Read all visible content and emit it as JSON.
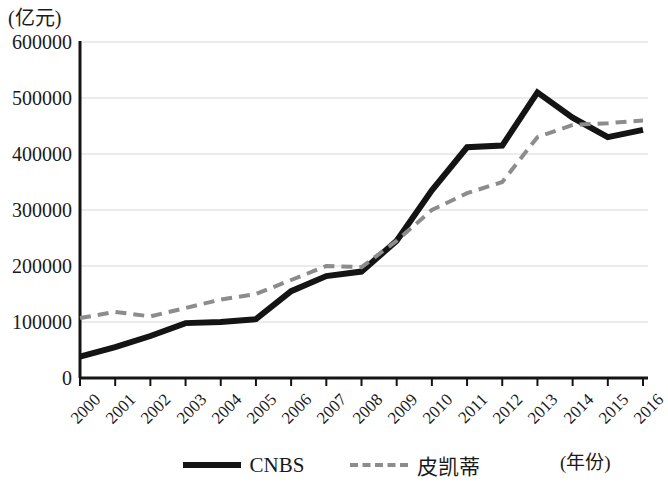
{
  "chart_data": {
    "type": "line",
    "title": "",
    "subtitle": "",
    "xlabel": "(年份)",
    "ylabel": "(亿元)",
    "x": [
      2000,
      2001,
      2002,
      2003,
      2004,
      2005,
      2006,
      2007,
      2008,
      2009,
      2010,
      2011,
      2012,
      2013,
      2014,
      2015,
      2016
    ],
    "xticklabels": [
      "2000",
      "2001",
      "2002",
      "2003",
      "2004",
      "2005",
      "2006",
      "2007",
      "2008",
      "2009",
      "2010",
      "2011",
      "2012",
      "2013",
      "2014",
      "2015",
      "2016"
    ],
    "yticks": [
      0,
      100000,
      200000,
      300000,
      400000,
      500000,
      600000
    ],
    "yticklabels": [
      "0",
      "100000",
      "200000",
      "300000",
      "400000",
      "500000",
      "600000"
    ],
    "ylim": [
      0,
      600000
    ],
    "xlim": [
      2000,
      2016
    ],
    "grid": true,
    "grid_axis": "y",
    "legend_position": "bottom",
    "series": [
      {
        "name": "CNBS",
        "style": "solid",
        "color": "#141414",
        "linewidth": 6,
        "values": [
          38000,
          55000,
          75000,
          98000,
          100000,
          105000,
          155000,
          182000,
          190000,
          245000,
          335000,
          412000,
          415000,
          510000,
          465000,
          430000,
          443000
        ]
      },
      {
        "name": "皮凯蒂",
        "style": "dashed",
        "color": "#8c8c8c",
        "linewidth": 4,
        "values": [
          107000,
          118000,
          110000,
          125000,
          140000,
          150000,
          175000,
          200000,
          198000,
          245000,
          300000,
          330000,
          350000,
          430000,
          452000,
          455000,
          460000
        ]
      }
    ]
  },
  "legend": {
    "items": [
      {
        "label": "CNBS",
        "style": "solid"
      },
      {
        "label": "皮凯蒂",
        "style": "dashed"
      }
    ]
  }
}
